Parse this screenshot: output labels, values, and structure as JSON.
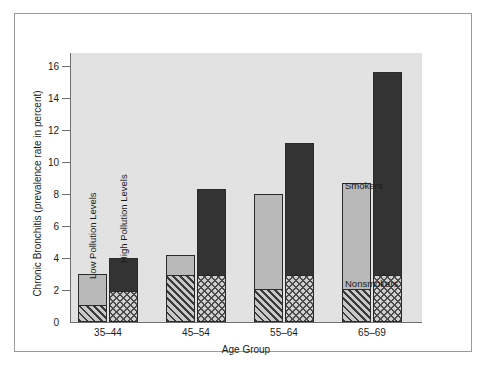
{
  "chart_data": {
    "type": "bar",
    "title": "",
    "xlabel": "Age Group",
    "ylabel": "Chronic Bronchitis (prevalence rate in percent)",
    "categories": [
      "35–44",
      "45–54",
      "55–64",
      "65–69"
    ],
    "ylim": [
      0,
      16
    ],
    "yticks": [
      0,
      2,
      4,
      6,
      8,
      10,
      12,
      14,
      16
    ],
    "grid": false,
    "legend_position": "inside-right",
    "stacked": true,
    "grouped": true,
    "group_labels": [
      "Low Pollution Levels",
      "High Pollution Levels"
    ],
    "segment_labels": [
      "Nonsmokers",
      "Smokers"
    ],
    "series": [
      {
        "name": "Low Pollution Levels – Nonsmokers",
        "pollution": "Low Pollution Levels",
        "segment": "Nonsmokers",
        "values": [
          1.1,
          3.0,
          2.1,
          2.1
        ]
      },
      {
        "name": "Low Pollution Levels – Smokers",
        "pollution": "Low Pollution Levels",
        "segment": "Smokers",
        "values": [
          1.9,
          1.2,
          5.9,
          6.6
        ]
      },
      {
        "name": "High Pollution Levels – Nonsmokers",
        "pollution": "High Pollution Levels",
        "segment": "Nonsmokers",
        "values": [
          2.0,
          3.0,
          3.0,
          3.0
        ]
      },
      {
        "name": "High Pollution Levels – Smokers",
        "pollution": "High Pollution Levels",
        "segment": "Smokers",
        "values": [
          2.0,
          5.3,
          8.2,
          12.6
        ]
      }
    ],
    "totals": {
      "low_pollution": [
        3.0,
        4.2,
        8.0,
        8.7
      ],
      "high_pollution": [
        4.0,
        8.3,
        11.2,
        15.6
      ]
    },
    "colors": {
      "smoker_low": "#b9b9b9",
      "smoker_high": "#333333",
      "nonsmoker_low": "#6a6a6a",
      "nonsmoker_high": "#cfcfcf",
      "plot_background": "#e2e2e2",
      "figure_background": "#ffffff",
      "axis": "#6f6f6f",
      "text": "#1c1c1c"
    }
  },
  "axes": {
    "y_title": "Chronic Bronchitis (prevalence rate in percent)",
    "x_title": "Age Group",
    "y_tick_labels": [
      "0",
      "2",
      "4",
      "6",
      "8",
      "10",
      "12",
      "14",
      "16"
    ],
    "x_tick_labels": [
      "35–44",
      "45–54",
      "55–64",
      "65–69"
    ]
  },
  "annotations": {
    "low_pollution_caption": "Low Pollution Levels",
    "high_pollution_caption": "High Pollution Levels",
    "smokers_label": "Smokers",
    "nonsmokers_label": "Nonsmokers"
  }
}
